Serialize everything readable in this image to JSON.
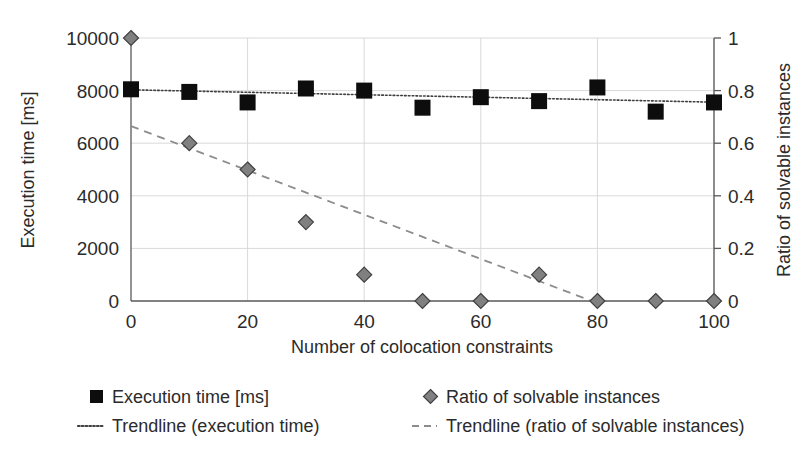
{
  "chart_data": {
    "type": "scatter",
    "title": "",
    "xlabel": "Number of colocation constraints",
    "ylabel": "Execution time [ms]",
    "y2label": "Ratio of solvable instances",
    "xlim": [
      0,
      100
    ],
    "ylim": [
      0,
      10000
    ],
    "y2lim": [
      0,
      1
    ],
    "xticks": [
      "0",
      "20",
      "40",
      "60",
      "80",
      "100"
    ],
    "xtick_values": [
      0,
      20,
      40,
      60,
      80,
      100
    ],
    "yticks": [
      "0",
      "2000",
      "4000",
      "6000",
      "8000",
      "10000"
    ],
    "ytick_values": [
      0,
      2000,
      4000,
      6000,
      8000,
      10000
    ],
    "y2ticks": [
      "0",
      "0.2",
      "0.4",
      "0.6",
      "0.8",
      "1"
    ],
    "y2tick_values": [
      0,
      0.2,
      0.4,
      0.6,
      0.8,
      1
    ],
    "grid": true,
    "legend_position": "bottom",
    "x": [
      0,
      10,
      20,
      30,
      40,
      50,
      60,
      70,
      80,
      90,
      100
    ],
    "series": [
      {
        "name": "Execution time [ms]",
        "axis": "left",
        "marker": "square",
        "color": "#0d0d0d",
        "values": [
          8050,
          7950,
          7550,
          8080,
          8000,
          7350,
          7750,
          7600,
          8120,
          7200,
          7550
        ]
      },
      {
        "name": "Ratio of solvable instances",
        "axis": "right",
        "marker": "diamond",
        "color": "#808080",
        "values": [
          1.0,
          0.6,
          0.5,
          0.3,
          0.1,
          0.0,
          0.0,
          0.1,
          0.0,
          0.0,
          0.0
        ]
      }
    ],
    "trendlines": [
      {
        "name": "Trendline (execution time)",
        "axis": "left",
        "style": "dotted",
        "color": "#3f3f3f",
        "x_start": 0,
        "y_start": 8030,
        "x_end": 100,
        "y_end": 7560
      },
      {
        "name": "Trendline (ratio of solvable instances)",
        "axis": "right",
        "style": "dashed",
        "color": "#8c8c8c",
        "x_start": 0,
        "y_start": 0.665,
        "x_end": 79,
        "y_end": 0.0
      }
    ]
  },
  "legend": {
    "items": [
      {
        "label": "Execution time [ms]",
        "marker": "square",
        "color": "#0d0d0d"
      },
      {
        "label": "Ratio of solvable instances",
        "marker": "diamond",
        "color": "#808080"
      },
      {
        "label": "Trendline (execution time)",
        "marker": "dotted-line",
        "color": "#3f3f3f"
      },
      {
        "label": "Trendline (ratio of solvable instances)",
        "marker": "dashed-line",
        "color": "#8c8c8c"
      }
    ]
  },
  "axes": {
    "left_title": "Execution time [ms]",
    "right_title": "Ratio of solvable instances",
    "x_title": "Number of colocation constraints"
  }
}
